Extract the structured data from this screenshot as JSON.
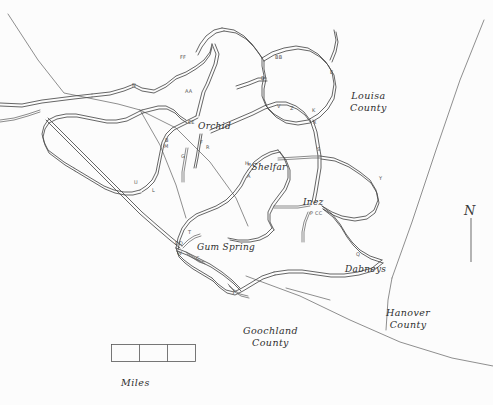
{
  "map": {
    "title_visible": false,
    "background_color": "#fcfcfc",
    "ink_color": "#4a4a4a",
    "towns": [
      {
        "name": "Orchid",
        "x": 203,
        "y": 127
      },
      {
        "name": "\"Shelfar",
        "x": 251,
        "y": 168
      },
      {
        "name": "Inez",
        "x": 306,
        "y": 203
      },
      {
        "name": "Gum Spring",
        "x": 201,
        "y": 248
      },
      {
        "name": "Dabneys",
        "x": 350,
        "y": 270
      }
    ],
    "counties": [
      {
        "name": "Louisa\nCounty",
        "line1": "Louisa",
        "line2": "County",
        "x": 356,
        "y": 96
      },
      {
        "name": "Goochland\nCounty",
        "line1": "Goochland",
        "line2": "County",
        "x": 249,
        "y": 331
      },
      {
        "name": "Hanover\nCounty",
        "line1": "Hanover",
        "line2": "County",
        "x": 391,
        "y": 313
      }
    ],
    "road_codes": [
      {
        "code": "FF",
        "x": 180,
        "y": 57
      },
      {
        "code": "N",
        "x": 132,
        "y": 85
      },
      {
        "code": "AA",
        "x": 185,
        "y": 91
      },
      {
        "code": "BB",
        "x": 275,
        "y": 57
      },
      {
        "code": "D",
        "x": 261,
        "y": 78
      },
      {
        "code": "E",
        "x": 330,
        "y": 72
      },
      {
        "code": "V",
        "x": 277,
        "y": 106
      },
      {
        "code": "Z",
        "x": 290,
        "y": 108
      },
      {
        "code": "K",
        "x": 312,
        "y": 110
      },
      {
        "code": "X",
        "x": 313,
        "y": 122
      },
      {
        "code": "EE",
        "x": 190,
        "y": 122
      },
      {
        "code": "F",
        "x": 200,
        "y": 142
      },
      {
        "code": "R",
        "x": 206,
        "y": 147
      },
      {
        "code": "G",
        "x": 181,
        "y": 156
      },
      {
        "code": "B",
        "x": 165,
        "y": 140
      },
      {
        "code": "M",
        "x": 164,
        "y": 146
      },
      {
        "code": "S",
        "x": 317,
        "y": 149
      },
      {
        "code": "Y",
        "x": 379,
        "y": 178
      },
      {
        "code": "H",
        "x": 245,
        "y": 163
      },
      {
        "code": "A",
        "x": 247,
        "y": 176
      },
      {
        "code": "U",
        "x": 134,
        "y": 182
      },
      {
        "code": "L",
        "x": 152,
        "y": 190
      },
      {
        "code": "P CC",
        "x": 313,
        "y": 213
      },
      {
        "code": "Q",
        "x": 356,
        "y": 254
      },
      {
        "code": "T",
        "x": 188,
        "y": 232
      },
      {
        "code": "DD",
        "x": 177,
        "y": 243
      },
      {
        "code": "W",
        "x": 177,
        "y": 253
      },
      {
        "code": "C",
        "x": 196,
        "y": 258
      },
      {
        "code": "J",
        "x": 233,
        "y": 291
      }
    ],
    "scale_bar": {
      "caption": "Miles",
      "segments": 3,
      "x": 111,
      "y": 344,
      "width": 84,
      "height": 17,
      "caption_x": 121,
      "caption_y": 385
    },
    "north_arrow": {
      "glyph": "N",
      "label": "north-arrow",
      "x": 468,
      "y": 205
    }
  }
}
